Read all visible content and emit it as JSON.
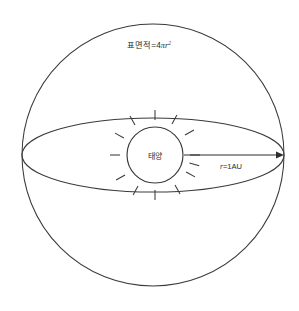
{
  "diagram": {
    "background_color": "#ffffff",
    "stroke_color": "#3a3a3a",
    "text_color": "#2b2b2b",
    "labels": {
      "surface_area_prefix": "표면적",
      "surface_area_equals": "=4",
      "surface_area_pi": "π",
      "surface_area_var": "r",
      "surface_area_exponent": "2",
      "surface_area_full": "표면적=4πr²",
      "sun": "태양",
      "radius_var": "r",
      "radius_value": "=1AU",
      "radius_full": "r=1AU"
    },
    "geometry": {
      "sphere_center_x": 153,
      "sphere_center_y": 155,
      "sphere_radius": 131,
      "ellipse_center_x": 153,
      "ellipse_center_y": 155,
      "ellipse_rx": 131,
      "ellipse_ry": 37,
      "sun_center_x": 155,
      "sun_center_y": 155,
      "sun_radius": 28,
      "sun_ray_count": 12,
      "arrow_start_x": 184,
      "arrow_end_x": 284,
      "arrow_y": 155
    }
  }
}
